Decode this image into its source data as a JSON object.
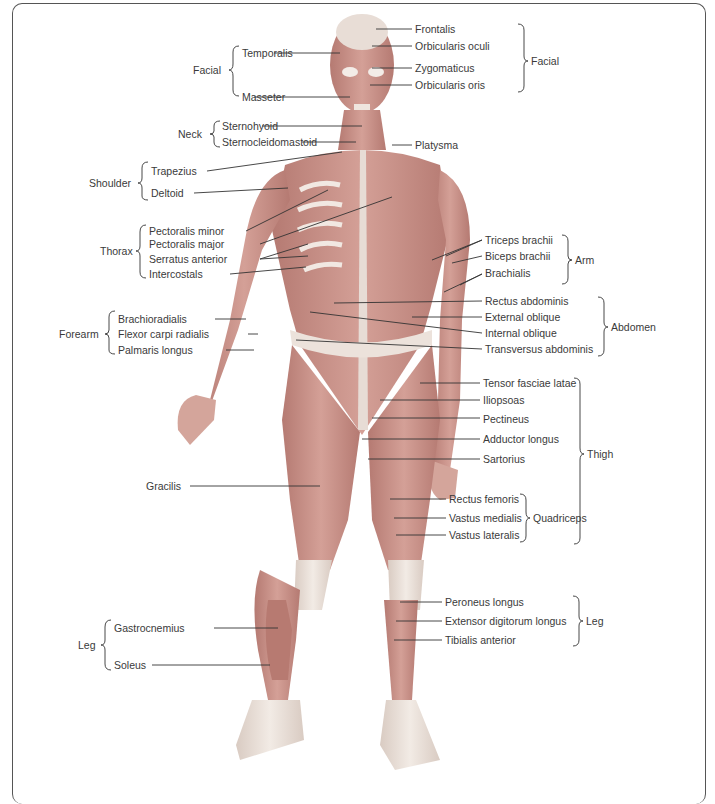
{
  "figure": {
    "type": "anatomical-diagram",
    "groups": [
      {
        "group": "Facial",
        "side": "left",
        "labels": [
          "Temporalis",
          "Masseter"
        ]
      },
      {
        "group": "Neck",
        "side": "left",
        "labels": [
          "Sternohyoid",
          "Sternocleidomastoid"
        ]
      },
      {
        "group": "Shoulder",
        "side": "left",
        "labels": [
          "Trapezius",
          "Deltoid"
        ]
      },
      {
        "group": "Thorax",
        "side": "left",
        "labels": [
          "Pectoralis minor",
          "Pectoralis major",
          "Serratus anterior",
          "Intercostals"
        ]
      },
      {
        "group": "Forearm",
        "side": "left",
        "labels": [
          "Brachioradialis",
          "Flexor carpi radialis",
          "Palmaris longus"
        ]
      },
      {
        "group": "Leg",
        "side": "left",
        "labels": [
          "Gastrocnemius",
          "Soleus"
        ]
      },
      {
        "group": "Facial",
        "side": "right",
        "labels": [
          "Frontalis",
          "Orbicularis oculi",
          "Zygomaticus",
          "Orbicularis oris"
        ]
      },
      {
        "group": "",
        "side": "right",
        "labels": [
          "Platysma"
        ]
      },
      {
        "group": "Arm",
        "side": "right",
        "labels": [
          "Triceps brachii",
          "Biceps brachii",
          "Brachialis"
        ]
      },
      {
        "group": "Abdomen",
        "side": "right",
        "labels": [
          "Rectus abdominis",
          "External oblique",
          "Internal oblique",
          "Transversus abdominis"
        ]
      },
      {
        "group": "Thigh",
        "side": "right",
        "labels": [
          "Tensor fasciae latae",
          "Iliopsoas",
          "Pectineus",
          "Adductor longus",
          "Sartorius"
        ]
      },
      {
        "group": "Quadriceps",
        "side": "right",
        "labels": [
          "Rectus femoris",
          "Vastus medialis",
          "Vastus lateralis"
        ]
      },
      {
        "group": "",
        "side": "left",
        "labels": [
          "Gracilis"
        ]
      },
      {
        "group": "Leg",
        "side": "right",
        "labels": [
          "Peroneus longus",
          "Extensor digitorum longus",
          "Tibialis anterior"
        ]
      }
    ]
  },
  "left": {
    "facial_group": "Facial",
    "temporalis": "Temporalis",
    "masseter": "Masseter",
    "neck_group": "Neck",
    "sternohyoid": "Sternohyoid",
    "sternocleidomastoid": "Sternocleidomastoid",
    "shoulder_group": "Shoulder",
    "trapezius": "Trapezius",
    "deltoid": "Deltoid",
    "thorax_group": "Thorax",
    "pectoralis_minor": "Pectoralis minor",
    "pectoralis_major": "Pectoralis major",
    "serratus_anterior": "Serratus anterior",
    "intercostals": "Intercostals",
    "forearm_group": "Forearm",
    "brachioradialis": "Brachioradialis",
    "flexor_carpi_radialis": "Flexor carpi radialis",
    "palmaris_longus": "Palmaris longus",
    "gracilis": "Gracilis",
    "leg_group": "Leg",
    "gastrocnemius": "Gastrocnemius",
    "soleus": "Soleus"
  },
  "right": {
    "frontalis": "Frontalis",
    "orbicularis_oculi": "Orbicularis oculi",
    "zygomaticus": "Zygomaticus",
    "orbicularis_oris": "Orbicularis oris",
    "facial_group": "Facial",
    "platysma": "Platysma",
    "triceps_brachii": "Triceps brachii",
    "biceps_brachii": "Biceps brachii",
    "brachialis": "Brachialis",
    "arm_group": "Arm",
    "rectus_abdominis": "Rectus abdominis",
    "external_oblique": "External oblique",
    "internal_oblique": "Internal oblique",
    "transversus_abdominis": "Transversus abdominis",
    "abdomen_group": "Abdomen",
    "tensor_fasciae_latae": "Tensor fasciae latae",
    "iliopsoas": "Iliopsoas",
    "pectineus": "Pectineus",
    "adductor_longus": "Adductor longus",
    "sartorius": "Sartorius",
    "thigh_group": "Thigh",
    "rectus_femoris": "Rectus femoris",
    "vastus_medialis": "Vastus medialis",
    "vastus_lateralis": "Vastus lateralis",
    "quadriceps_group": "Quadriceps",
    "peroneus_longus": "Peroneus longus",
    "extensor_digitorum_longus": "Extensor digitorum longus",
    "tibialis_anterior": "Tibialis anterior",
    "leg_group": "Leg"
  },
  "colors": {
    "muscle": "#c98f86",
    "muscle_dark": "#a96a62",
    "tendon": "#ece3dc",
    "line": "#333333",
    "frame": "#555555"
  }
}
